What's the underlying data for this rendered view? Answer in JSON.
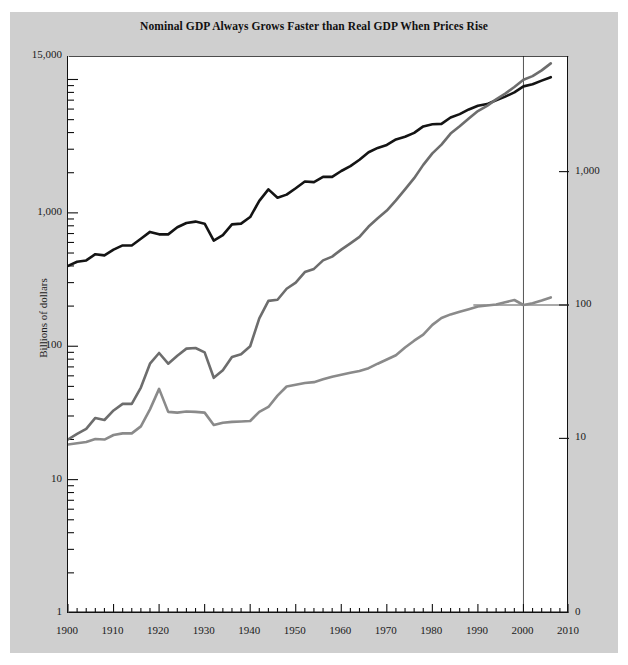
{
  "chart_data": {
    "type": "line",
    "title": "Nominal GDP Always Grows Faster than Real GDP When Prices Rise",
    "xlabel": "",
    "ylabel": "Billions of dollars",
    "y2label": "Price index (the year 2000=100)",
    "xlim": [
      1900,
      2010
    ],
    "ylim": [
      1,
      15000
    ],
    "y2lim": [
      0.1,
      1000
    ],
    "yscale": "log",
    "y2scale": "log",
    "grid": false,
    "legend_position": "inline-annotations",
    "xticks": [
      1900,
      1910,
      1920,
      1930,
      1940,
      1950,
      1960,
      1970,
      1980,
      1990,
      2000,
      2010
    ],
    "xtick_labels": [
      "1900",
      "1910",
      "1920",
      "1930",
      "1940",
      "1950",
      "1960",
      "1970",
      "1980",
      "1990",
      "2000",
      "2010"
    ],
    "xminor_step": 2,
    "yticks": [
      1,
      10,
      100,
      1000,
      15000
    ],
    "ytick_labels": [
      "1",
      "10",
      "100",
      "1,000",
      "15,000"
    ],
    "y2ticks": [
      10,
      100,
      1000
    ],
    "y2tick_labels": [
      "10",
      "100",
      "1,000"
    ],
    "y2_bottom_label": "0",
    "annotations": [
      {
        "text": "Real GDP (left scale)",
        "x": 1936,
        "y": 430
      },
      {
        "text": "Nominal GDP (left scale)",
        "x": 1936,
        "y": 41
      },
      {
        "text": "Implicit GDP deflator (right scale)",
        "x": 1939,
        "y": 2.4
      }
    ],
    "reference_lines": [
      {
        "orientation": "vertical",
        "x": 2000,
        "color": "#555555"
      },
      {
        "orientation": "horizontal_right",
        "y2": 100,
        "from_x": 1989,
        "to_x": 2010,
        "color": "#555555"
      }
    ],
    "series": [
      {
        "name": "Real GDP (left scale)",
        "axis": "left",
        "color": "#141414",
        "width": 2.6,
        "x": [
          1900,
          1902,
          1904,
          1906,
          1908,
          1910,
          1912,
          1914,
          1916,
          1918,
          1920,
          1922,
          1924,
          1926,
          1928,
          1930,
          1932,
          1934,
          1936,
          1938,
          1940,
          1942,
          1944,
          1946,
          1948,
          1950,
          1952,
          1954,
          1956,
          1958,
          1960,
          1962,
          1964,
          1966,
          1968,
          1970,
          1972,
          1974,
          1976,
          1978,
          1980,
          1982,
          1984,
          1986,
          1988,
          1990,
          1992,
          1994,
          1996,
          1998,
          2000,
          2002,
          2004,
          2006
        ],
        "values": [
          400,
          430,
          440,
          490,
          480,
          530,
          570,
          570,
          640,
          720,
          690,
          690,
          780,
          840,
          860,
          830,
          620,
          680,
          820,
          830,
          930,
          1230,
          1500,
          1300,
          1370,
          1530,
          1720,
          1700,
          1860,
          1860,
          2060,
          2240,
          2500,
          2850,
          3070,
          3230,
          3550,
          3720,
          3980,
          4450,
          4620,
          4650,
          5190,
          5500,
          5960,
          6350,
          6540,
          6990,
          7440,
          8010,
          8880,
          9200,
          9800,
          10400
        ]
      },
      {
        "name": "Nominal GDP (left scale)",
        "axis": "left",
        "color": "#6d6d6d",
        "width": 2.6,
        "x": [
          1900,
          1902,
          1904,
          1906,
          1908,
          1910,
          1912,
          1914,
          1916,
          1918,
          1920,
          1922,
          1924,
          1926,
          1928,
          1930,
          1932,
          1934,
          1936,
          1938,
          1940,
          1942,
          1944,
          1946,
          1948,
          1950,
          1952,
          1954,
          1956,
          1958,
          1960,
          1962,
          1964,
          1966,
          1968,
          1970,
          1972,
          1974,
          1976,
          1978,
          1980,
          1982,
          1984,
          1986,
          1988,
          1990,
          1992,
          1994,
          1996,
          1998,
          2000,
          2002,
          2004,
          2006
        ],
        "values": [
          20,
          22,
          24,
          29,
          28,
          33,
          37,
          37,
          49,
          74,
          89,
          74,
          85,
          96,
          97,
          90,
          58,
          66,
          83,
          87,
          100,
          162,
          219,
          223,
          270,
          300,
          360,
          380,
          440,
          470,
          530,
          590,
          660,
          790,
          910,
          1040,
          1240,
          1500,
          1820,
          2290,
          2790,
          3250,
          3930,
          4460,
          5100,
          5800,
          6340,
          7090,
          7840,
          8790,
          9950,
          10600,
          11700,
          13200
        ]
      },
      {
        "name": "Implicit GDP deflator (right scale)",
        "axis": "right",
        "color": "#8a8a8a",
        "width": 2.6,
        "x": [
          1900,
          1902,
          1904,
          1906,
          1908,
          1910,
          1912,
          1914,
          1916,
          1918,
          1920,
          1922,
          1924,
          1926,
          1928,
          1930,
          1932,
          1934,
          1936,
          1938,
          1940,
          1942,
          1944,
          1946,
          1948,
          1950,
          1952,
          1954,
          1956,
          1958,
          1960,
          1962,
          1964,
          1966,
          1968,
          1970,
          1972,
          1974,
          1976,
          1978,
          1980,
          1982,
          1984,
          1986,
          1988,
          1990,
          1992,
          1994,
          1996,
          1998,
          2000,
          2002,
          2004,
          2006
        ],
        "values": [
          9.0,
          9.2,
          9.4,
          9.9,
          9.8,
          10.6,
          10.9,
          10.9,
          12.3,
          16.5,
          23.5,
          15.8,
          15.6,
          15.9,
          15.8,
          15.6,
          12.6,
          13.1,
          13.3,
          13.4,
          13.5,
          15.8,
          17.2,
          20.9,
          24.5,
          25.2,
          26.0,
          26.4,
          27.7,
          29.0,
          30.0,
          31.0,
          32.0,
          33.6,
          36.3,
          39.0,
          42.0,
          48.0,
          54.0,
          60.0,
          71.0,
          80.0,
          85.0,
          89.0,
          93.0,
          97.5,
          99.0,
          101.0,
          105.0,
          109.0,
          100.0,
          103.0,
          108.0,
          114.0
        ]
      }
    ]
  },
  "axes": {
    "left_title": "Billions of dollars",
    "right_title": "Price index (the year 2000=100)"
  }
}
